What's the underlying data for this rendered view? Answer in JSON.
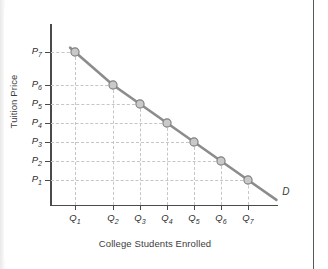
{
  "chart_data": {
    "type": "line",
    "title": "",
    "xlabel": "College Students Enrolled",
    "ylabel": "Tuition Price",
    "grid": true,
    "legend_position": "inline-curve-label",
    "curve_label": "D",
    "categories": [
      "Q1",
      "Q2",
      "Q3",
      "Q4",
      "Q5",
      "Q6",
      "Q7"
    ],
    "x_tick_labels": [
      "Q",
      "Q",
      "Q",
      "Q",
      "Q",
      "Q",
      "Q"
    ],
    "x_tick_subscripts": [
      "1",
      "2",
      "3",
      "4",
      "5",
      "6",
      "7"
    ],
    "y_tick_labels": [
      "P",
      "P",
      "P",
      "P",
      "P",
      "P",
      "P"
    ],
    "y_tick_subscripts": [
      "7",
      "6",
      "5",
      "4",
      "3",
      "2",
      "1"
    ],
    "series": [
      {
        "name": "D",
        "points": [
          {
            "x": "Q1",
            "y": "P7"
          },
          {
            "x": "Q2",
            "y": "P6"
          },
          {
            "x": "Q3",
            "y": "P5"
          },
          {
            "x": "Q4",
            "y": "P4"
          },
          {
            "x": "Q5",
            "y": "P3"
          },
          {
            "x": "Q6",
            "y": "P2"
          },
          {
            "x": "Q7",
            "y": "P1"
          }
        ],
        "values": [
          7,
          6,
          5,
          4,
          3,
          2,
          1
        ]
      }
    ],
    "x_pixel_positions": [
      75,
      113,
      140,
      167,
      194,
      221,
      248
    ],
    "y_pixel_positions": [
      52,
      85,
      104,
      123,
      142,
      161,
      180
    ],
    "line_color": "#8c8c8c",
    "marker_fill": "#c9c9c9",
    "marker_edge": "#7d7d7d",
    "grid_color": "#c6c6c6",
    "axis_color": "#4a4a4a",
    "text_color": "#2e2e2e"
  },
  "axes": {
    "y_title": "Tuition Price",
    "x_title": "College Students Enrolled"
  },
  "curve": {
    "label": "D"
  },
  "y_labels": [
    {
      "base": "P",
      "sub": "7"
    },
    {
      "base": "P",
      "sub": "6"
    },
    {
      "base": "P",
      "sub": "5"
    },
    {
      "base": "P",
      "sub": "4"
    },
    {
      "base": "P",
      "sub": "3"
    },
    {
      "base": "P",
      "sub": "2"
    },
    {
      "base": "P",
      "sub": "1"
    }
  ],
  "x_labels": [
    {
      "base": "Q",
      "sub": "1"
    },
    {
      "base": "Q",
      "sub": "2"
    },
    {
      "base": "Q",
      "sub": "3"
    },
    {
      "base": "Q",
      "sub": "4"
    },
    {
      "base": "Q",
      "sub": "5"
    },
    {
      "base": "Q",
      "sub": "6"
    },
    {
      "base": "Q",
      "sub": "7"
    }
  ]
}
